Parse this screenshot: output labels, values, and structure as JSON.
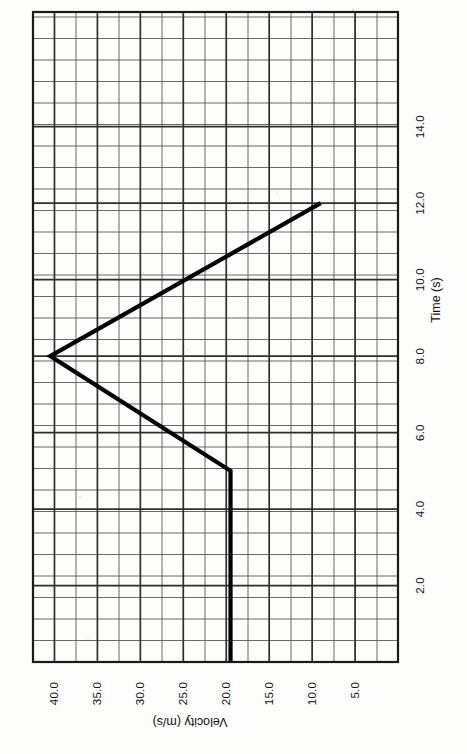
{
  "figure": {
    "orientation_note": "page-rotated-90-clockwise",
    "background_color": "#fdfdfb",
    "line_color": "#000000",
    "grid_color": "#585858",
    "grid_major_color": "#2e2e2e",
    "frame_color": "#1a1a1a"
  },
  "axes": {
    "time": {
      "title": "Time (s)",
      "tick_labels": [
        "2.0",
        "4.0",
        "6.0",
        "8.0",
        "10.0",
        "12.0",
        "14.0"
      ],
      "tick_values": [
        2.0,
        4.0,
        6.0,
        8.0,
        10.0,
        12.0,
        14.0
      ],
      "min": 0.0,
      "max": 17.0
    },
    "velocity": {
      "title": "Velocity (m/s)",
      "tick_labels": [
        "5.0",
        "10.0",
        "15.0",
        "20.0",
        "25.0",
        "30.0",
        "35.0",
        "40.0"
      ],
      "tick_values": [
        5.0,
        10.0,
        15.0,
        20.0,
        25.0,
        30.0,
        35.0,
        40.0
      ],
      "min": 0.0,
      "max": 42.5
    }
  },
  "chart_data": {
    "type": "line",
    "title": "",
    "subtitle": "",
    "xlabel": "Time (s)",
    "ylabel": "Velocity (m/s)",
    "xlim": [
      0.0,
      17.0
    ],
    "ylim": [
      0.0,
      42.5
    ],
    "grid": true,
    "legend": false,
    "legend_position": "none",
    "xticks": [
      2.0,
      4.0,
      6.0,
      8.0,
      10.0,
      12.0,
      14.0
    ],
    "yticks": [
      5.0,
      10.0,
      15.0,
      20.0,
      25.0,
      30.0,
      35.0,
      40.0
    ],
    "series": [
      {
        "name": "velocity",
        "x": [
          0.0,
          5.0,
          8.0,
          12.0
        ],
        "values": [
          19.5,
          19.5,
          40.5,
          9.0
        ]
      }
    ],
    "annotations": []
  }
}
